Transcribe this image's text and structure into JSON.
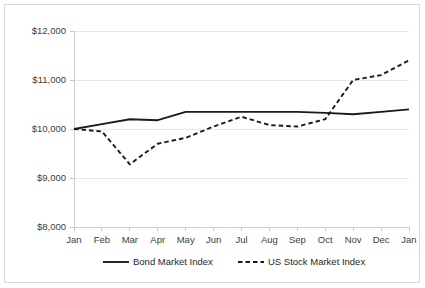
{
  "chart_data": {
    "type": "line",
    "title": "",
    "subtitle": "",
    "xlabel": "",
    "ylabel": "",
    "grid": true,
    "legend_position": "bottom",
    "categories": [
      "Jan",
      "Feb",
      "Mar",
      "Apr",
      "May",
      "Jun",
      "Jul",
      "Aug",
      "Sep",
      "Oct",
      "Nov",
      "Dec",
      "Jan"
    ],
    "ylim": [
      8000,
      12000
    ],
    "ytick_labels": [
      "$12,000",
      "$11,000",
      "$10,000",
      "$9,000",
      "$8,000"
    ],
    "ytick_values": [
      12000,
      11000,
      10000,
      9000,
      8000
    ],
    "series": [
      {
        "name": "Bond Market Index",
        "style": "solid",
        "color": "#1a1a1a",
        "values": [
          10000,
          10100,
          10200,
          10180,
          10350,
          10350,
          10350,
          10350,
          10350,
          10330,
          10300,
          10350,
          10400
        ]
      },
      {
        "name": "US Stock Market Index",
        "style": "dashed",
        "color": "#1a1a1a",
        "values": [
          10000,
          9950,
          9280,
          9700,
          9820,
          10050,
          10250,
          10080,
          10050,
          10200,
          11000,
          11100,
          11400
        ]
      }
    ]
  },
  "legend": {
    "entries": [
      {
        "label": "Bond Market Index",
        "style": "solid"
      },
      {
        "label": "US Stock Market Index",
        "style": "dashed"
      }
    ]
  }
}
